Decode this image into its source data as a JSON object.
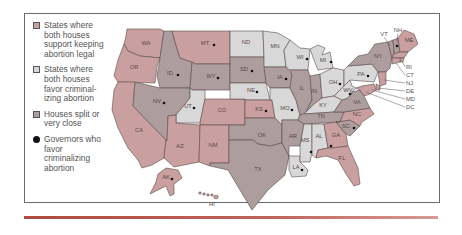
{
  "colors": {
    "legal": "#c9a09f",
    "criminalize": "#d8d8d8",
    "split": "#ad9d9e",
    "governor_dot": "#111111",
    "border": "#6a6a6a",
    "bottom_rule": "#b04a40"
  },
  "legend": {
    "items": [
      {
        "key": "legal",
        "label": "States where both houses support keeping abortion legal"
      },
      {
        "key": "criminalize",
        "label": "States where both houses favor criminal-izing abortion"
      },
      {
        "key": "split",
        "label": "Houses split or very close"
      },
      {
        "key": "governor",
        "label": "Governors who favor criminalizing abortion"
      }
    ]
  },
  "states": [
    {
      "abbr": "WA",
      "category": "legal",
      "governor": false
    },
    {
      "abbr": "OR",
      "category": "legal",
      "governor": false
    },
    {
      "abbr": "CA",
      "category": "legal",
      "governor": false
    },
    {
      "abbr": "NV",
      "category": "split",
      "governor": true
    },
    {
      "abbr": "ID",
      "category": "split",
      "governor": true
    },
    {
      "abbr": "MT",
      "category": "legal",
      "governor": true
    },
    {
      "abbr": "WY",
      "category": "split",
      "governor": true
    },
    {
      "abbr": "UT",
      "category": "criminalize",
      "governor": true
    },
    {
      "abbr": "AZ",
      "category": "legal",
      "governor": false
    },
    {
      "abbr": "CO",
      "category": "legal",
      "governor": false
    },
    {
      "abbr": "NM",
      "category": "legal",
      "governor": false
    },
    {
      "abbr": "ND",
      "category": "criminalize",
      "governor": false
    },
    {
      "abbr": "SD",
      "category": "split",
      "governor": true
    },
    {
      "abbr": "NE",
      "category": "criminalize",
      "governor": true
    },
    {
      "abbr": "KS",
      "category": "legal",
      "governor": true
    },
    {
      "abbr": "OK",
      "category": "split",
      "governor": false
    },
    {
      "abbr": "TX",
      "category": "split",
      "governor": false
    },
    {
      "abbr": "MN",
      "category": "criminalize",
      "governor": false
    },
    {
      "abbr": "IA",
      "category": "split",
      "governor": true
    },
    {
      "abbr": "MO",
      "category": "criminalize",
      "governor": true
    },
    {
      "abbr": "AR",
      "category": "split",
      "governor": false
    },
    {
      "abbr": "LA",
      "category": "criminalize",
      "governor": true
    },
    {
      "abbr": "WI",
      "category": "criminalize",
      "governor": true
    },
    {
      "abbr": "IL",
      "category": "split",
      "governor": false
    },
    {
      "abbr": "MI",
      "category": "criminalize",
      "governor": true
    },
    {
      "abbr": "IN",
      "category": "split",
      "governor": false
    },
    {
      "abbr": "OH",
      "category": "criminalize",
      "governor": true
    },
    {
      "abbr": "KY",
      "category": "criminalize",
      "governor": false
    },
    {
      "abbr": "TN",
      "category": "split",
      "governor": false
    },
    {
      "abbr": "MS",
      "category": "criminalize",
      "governor": true
    },
    {
      "abbr": "AL",
      "category": "criminalize",
      "governor": true
    },
    {
      "abbr": "GA",
      "category": "legal",
      "governor": false
    },
    {
      "abbr": "FL",
      "category": "legal",
      "governor": false
    },
    {
      "abbr": "SC",
      "category": "split",
      "governor": true
    },
    {
      "abbr": "NC",
      "category": "legal",
      "governor": false
    },
    {
      "abbr": "VA",
      "category": "split",
      "governor": false
    },
    {
      "abbr": "WV",
      "category": "criminalize",
      "governor": true
    },
    {
      "abbr": "PA",
      "category": "criminalize",
      "governor": true
    },
    {
      "abbr": "NY",
      "category": "split",
      "governor": false
    },
    {
      "abbr": "VT",
      "category": "split",
      "governor": false
    },
    {
      "abbr": "NH",
      "category": "split",
      "governor": true
    },
    {
      "abbr": "ME",
      "category": "legal",
      "governor": false
    },
    {
      "abbr": "MA",
      "category": "legal",
      "governor": false
    },
    {
      "abbr": "RI",
      "category": "legal",
      "governor": false
    },
    {
      "abbr": "CT",
      "category": "legal",
      "governor": false
    },
    {
      "abbr": "NJ",
      "category": "legal",
      "governor": false
    },
    {
      "abbr": "DE",
      "category": "legal",
      "governor": false
    },
    {
      "abbr": "MD",
      "category": "legal",
      "governor": false
    },
    {
      "abbr": "DC",
      "category": "legal",
      "governor": false
    },
    {
      "abbr": "AK",
      "category": "legal",
      "governor": true
    },
    {
      "abbr": "HI",
      "category": "legal",
      "governor": false
    }
  ],
  "callouts": [
    "VT",
    "NH",
    "RI",
    "CT",
    "NJ",
    "DE",
    "MD",
    "DC"
  ]
}
